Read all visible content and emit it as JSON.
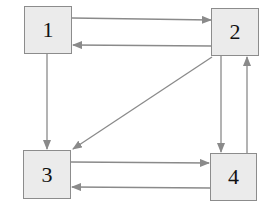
{
  "diagram": {
    "type": "directed-graph",
    "colors": {
      "node_fill": "#ebebeb",
      "node_border": "#8c8c8c",
      "edge": "#8a8a8a",
      "label": "#111111"
    },
    "nodes": [
      {
        "id": "1",
        "label": "1"
      },
      {
        "id": "2",
        "label": "2"
      },
      {
        "id": "3",
        "label": "3"
      },
      {
        "id": "4",
        "label": "4"
      }
    ],
    "edges": [
      {
        "from": "1",
        "to": "2"
      },
      {
        "from": "2",
        "to": "1"
      },
      {
        "from": "1",
        "to": "3"
      },
      {
        "from": "2",
        "to": "3"
      },
      {
        "from": "2",
        "to": "4"
      },
      {
        "from": "4",
        "to": "2"
      },
      {
        "from": "3",
        "to": "4"
      },
      {
        "from": "4",
        "to": "3"
      }
    ]
  }
}
